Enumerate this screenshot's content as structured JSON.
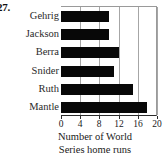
{
  "problem": {
    "number": "27."
  },
  "chart_data": {
    "type": "bar",
    "orientation": "horizontal",
    "title": "",
    "subtitle": "",
    "xlabel": "Number of World Series home runs",
    "xlabel_lines": [
      "Number of World",
      "Series home runs"
    ],
    "ylabel": "",
    "categories": [
      "Gehrig",
      "Jackson",
      "Berra",
      "Snider",
      "Ruth",
      "Mantle"
    ],
    "values": [
      10,
      10,
      12,
      11,
      15,
      18
    ],
    "xlim": [
      0,
      20
    ],
    "xticks": [
      0,
      4,
      8,
      12,
      16,
      20
    ],
    "xtick_labels": [
      "0",
      "4",
      "8",
      "12",
      "16",
      "20"
    ],
    "grid": "vertical",
    "legend": "none",
    "bar_color": "#080808",
    "grid_color": "#a6a6a6",
    "axis_color": "#2b2b2b",
    "background_color": "#ffffff"
  }
}
